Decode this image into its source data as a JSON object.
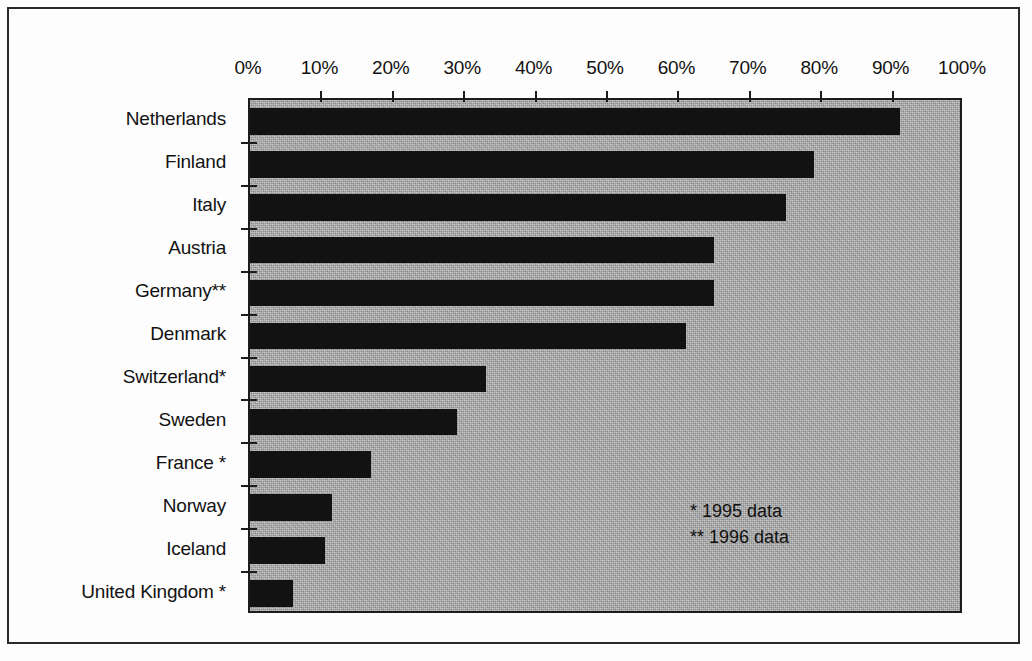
{
  "chart_data": {
    "type": "bar",
    "orientation": "horizontal",
    "title": "",
    "subtitle": "",
    "xlabel": "",
    "ylabel": "",
    "xlim": [
      0,
      100
    ],
    "xtick_labels": [
      "0%",
      "10%",
      "20%",
      "30%",
      "40%",
      "50%",
      "60%",
      "70%",
      "80%",
      "90%",
      "100%"
    ],
    "xtick_values": [
      0,
      10,
      20,
      30,
      40,
      50,
      60,
      70,
      80,
      90,
      100
    ],
    "grid": false,
    "legend": false,
    "axis_position": "top",
    "categories": [
      "Netherlands",
      "Finland",
      "Italy",
      "Austria",
      "Germany**",
      "Denmark",
      "Switzerland*",
      "Sweden",
      "France *",
      "Norway",
      "Iceland",
      "United Kingdom *"
    ],
    "values": [
      91,
      79,
      75,
      65,
      65,
      61,
      33,
      29,
      17,
      11.5,
      10.5,
      6
    ],
    "bar_color": "#121212",
    "plot_background_color": "#a9a9a9",
    "annotations": [
      "* 1995 data",
      "** 1996 data"
    ]
  },
  "footnotes": {
    "single_star": "* 1995 data",
    "double_star": "** 1996 data"
  }
}
